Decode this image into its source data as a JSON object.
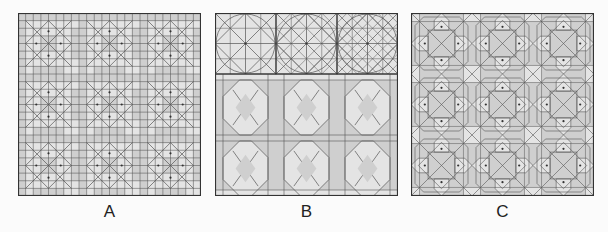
{
  "figure": {
    "panels": [
      {
        "id": "A",
        "label": "A",
        "description": "Fine square grid with 3x3 repeat of eight-point star construction lines over light/dark gray cells"
      },
      {
        "id": "B",
        "label": "B",
        "description": "Top row: three circle-in-square construction diagrams of increasing density; below: 3x2 repeat of octagonal cross pattern"
      },
      {
        "id": "C",
        "label": "C",
        "description": "3x3 repeat of interlaced eight-point star pattern with kite shaped light cells on gray background"
      }
    ],
    "colors": {
      "background": "#fbfbfb",
      "cell_light": "#e4e4e4",
      "cell_dark": "#cfcfcf",
      "line": "#555555",
      "border": "#333333",
      "dot": "#333333"
    },
    "grid": {
      "repeat": 3,
      "panel_size": 183
    }
  }
}
